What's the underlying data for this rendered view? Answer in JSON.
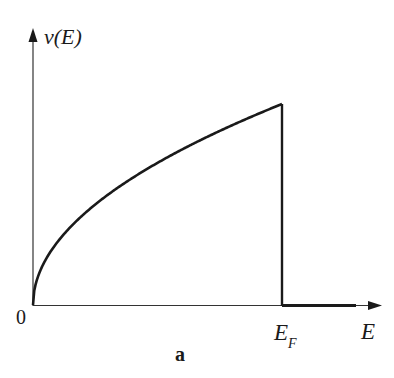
{
  "chart_data": {
    "type": "line",
    "title": "",
    "panel_label": "a",
    "xlabel": "E",
    "ylabel": "ν(E)",
    "x_ticks": [
      "0",
      "E_F"
    ],
    "x": [
      0,
      0.05,
      0.1,
      0.2,
      0.3,
      0.4,
      0.5,
      0.6,
      0.7,
      0.8,
      0.9,
      1.0,
      1.0,
      1.3
    ],
    "y": [
      0,
      0.224,
      0.316,
      0.447,
      0.548,
      0.632,
      0.707,
      0.775,
      0.837,
      0.894,
      0.949,
      1.0,
      0,
      0
    ],
    "x_units": "fraction of E_F",
    "y_units": "relative to ν(E_F)",
    "grid": false,
    "legend": null
  },
  "labels": {
    "y_axis": "ν(E)",
    "x_axis": "E",
    "origin": "0",
    "fermi_main": "E",
    "fermi_sub": "F",
    "panel": "a"
  }
}
